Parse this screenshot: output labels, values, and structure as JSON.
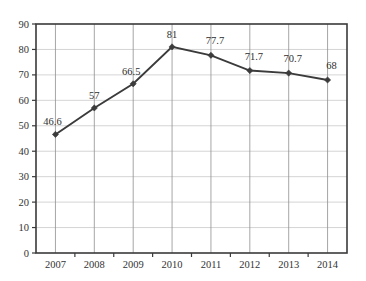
{
  "chart_data": {
    "type": "line",
    "title": "",
    "subtitle": "",
    "xlabel": "",
    "ylabel": "",
    "categories": [
      "2007",
      "2008",
      "2009",
      "2010",
      "2011",
      "2012",
      "2013",
      "2014"
    ],
    "values": [
      46.6,
      57,
      66.5,
      81,
      77.7,
      71.7,
      70.7,
      68
    ],
    "point_labels": [
      "46.6",
      "57",
      "66.5",
      "81",
      "77.7",
      "71.7",
      "70.7",
      "68"
    ],
    "ylim": [
      0,
      90
    ],
    "ytick_values": [
      0,
      10,
      20,
      30,
      40,
      50,
      60,
      70,
      80,
      90
    ],
    "ytick_labels": [
      "0",
      "10",
      "20",
      "30",
      "40",
      "50",
      "60",
      "70",
      "80",
      "90"
    ],
    "xtick_labels": [
      "2007",
      "2008",
      "2009",
      "2010",
      "2011",
      "2012",
      "2013",
      "2014"
    ],
    "grid": {
      "horizontal": true,
      "vertical": true
    },
    "legend": {
      "visible": false,
      "position": "none",
      "entries": []
    },
    "marker": "diamond",
    "colors": {
      "line": "#3b3b3b",
      "marker": "#3b3b3b",
      "grid_horizontal": "#c9c9c9",
      "grid_vertical": "#8f8f8f",
      "plot_border": "#3a3a3a",
      "background": "#ffffff",
      "text": "#333333"
    }
  }
}
